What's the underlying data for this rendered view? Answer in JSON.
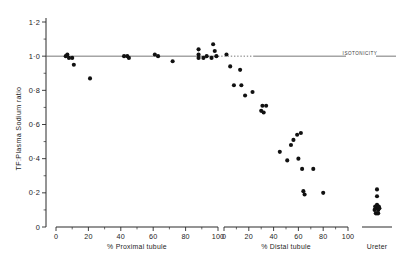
{
  "chart_data": {
    "type": "scatter",
    "title": "",
    "ylabel": "TF:Plasma Sodium ratio",
    "ylim": [
      0,
      1.2
    ],
    "yticks": [
      0,
      0.2,
      0.4,
      0.6,
      0.8,
      1.0,
      1.2
    ],
    "ytick_labels": [
      "0",
      "0·2",
      "0·4",
      "0·6",
      "0·8",
      "1·0",
      "1·2"
    ],
    "grid": false,
    "legend": null,
    "annotations": [
      {
        "text": "ISOTONICITY",
        "y": 1.0,
        "note": "horizontal reference line drawn at TF:P ratio = 1.0 across full plot width"
      }
    ],
    "panels": [
      {
        "name": "proximal",
        "xlabel": "% Proximal tubule",
        "xlim": [
          0,
          100
        ],
        "xticks": [
          0,
          20,
          40,
          60,
          80,
          100
        ],
        "xtick_labels": [
          "0",
          "20",
          "40",
          "60",
          "80",
          "100"
        ],
        "points": [
          {
            "x": 6,
            "y": 1.0
          },
          {
            "x": 7,
            "y": 1.01
          },
          {
            "x": 8,
            "y": 0.99
          },
          {
            "x": 10,
            "y": 0.99
          },
          {
            "x": 11,
            "y": 0.95
          },
          {
            "x": 21,
            "y": 0.87
          },
          {
            "x": 42,
            "y": 1.0
          },
          {
            "x": 44,
            "y": 1.0
          },
          {
            "x": 45,
            "y": 0.99
          },
          {
            "x": 61,
            "y": 1.01
          },
          {
            "x": 63,
            "y": 1.0
          },
          {
            "x": 72,
            "y": 0.97
          },
          {
            "x": 88,
            "y": 1.04
          },
          {
            "x": 88,
            "y": 1.01
          },
          {
            "x": 88,
            "y": 0.99
          },
          {
            "x": 91,
            "y": 0.99
          },
          {
            "x": 93,
            "y": 1.0
          },
          {
            "x": 96,
            "y": 0.99
          },
          {
            "x": 97,
            "y": 1.07
          },
          {
            "x": 98,
            "y": 1.03
          },
          {
            "x": 99,
            "y": 1.0
          }
        ]
      },
      {
        "name": "distal",
        "xlabel": "% Distal tubule",
        "xlim": [
          0,
          100
        ],
        "xticks": [
          0,
          20,
          40,
          60,
          80,
          100
        ],
        "xtick_labels": [
          "0",
          "20",
          "40",
          "60",
          "80",
          "100"
        ],
        "points": [
          {
            "x": 2,
            "y": 1.01
          },
          {
            "x": 5,
            "y": 0.94
          },
          {
            "x": 13,
            "y": 0.92
          },
          {
            "x": 8,
            "y": 0.83
          },
          {
            "x": 14,
            "y": 0.83
          },
          {
            "x": 17,
            "y": 0.77
          },
          {
            "x": 23,
            "y": 0.79
          },
          {
            "x": 30,
            "y": 0.68
          },
          {
            "x": 31,
            "y": 0.71
          },
          {
            "x": 34,
            "y": 0.71
          },
          {
            "x": 32,
            "y": 0.67
          },
          {
            "x": 45,
            "y": 0.44
          },
          {
            "x": 54,
            "y": 0.48
          },
          {
            "x": 56,
            "y": 0.51
          },
          {
            "x": 59,
            "y": 0.54
          },
          {
            "x": 62,
            "y": 0.55
          },
          {
            "x": 51,
            "y": 0.39
          },
          {
            "x": 60,
            "y": 0.4
          },
          {
            "x": 63,
            "y": 0.34
          },
          {
            "x": 72,
            "y": 0.34
          },
          {
            "x": 64,
            "y": 0.21
          },
          {
            "x": 65,
            "y": 0.19
          },
          {
            "x": 80,
            "y": 0.2
          }
        ]
      },
      {
        "name": "ureter",
        "xlabel": "Ureter",
        "points": [
          {
            "x": 0.5,
            "y": 0.22
          },
          {
            "x": 0.5,
            "y": 0.18
          },
          {
            "x": 0.42,
            "y": 0.1
          },
          {
            "x": 0.46,
            "y": 0.11
          },
          {
            "x": 0.5,
            "y": 0.11
          },
          {
            "x": 0.54,
            "y": 0.1
          },
          {
            "x": 0.58,
            "y": 0.11
          },
          {
            "x": 0.46,
            "y": 0.08
          },
          {
            "x": 0.5,
            "y": 0.08
          },
          {
            "x": 0.54,
            "y": 0.08
          },
          {
            "x": 0.5,
            "y": 0.13
          },
          {
            "x": 0.44,
            "y": 0.12
          },
          {
            "x": 0.56,
            "y": 0.12
          }
        ]
      }
    ]
  }
}
